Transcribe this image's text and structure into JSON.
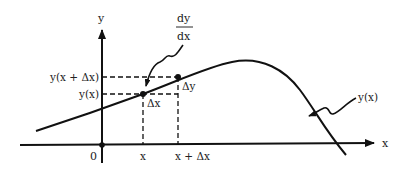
{
  "figure": {
    "type": "derivative-diagram",
    "colors": {
      "ink": "#111111",
      "background": "#ffffff"
    },
    "axes": {
      "y_label": "y",
      "x_label": "x",
      "origin_label": "0"
    },
    "tick_labels": {
      "x1": "x",
      "x2": "x + Δx",
      "y1": "y(x)",
      "y2": "y(x + Δx)"
    },
    "increment_labels": {
      "dx": "Δx",
      "dy": "Δy"
    },
    "derivative_label": {
      "numerator": "dy",
      "denominator": "dx"
    },
    "curve_label": "y(x)"
  }
}
